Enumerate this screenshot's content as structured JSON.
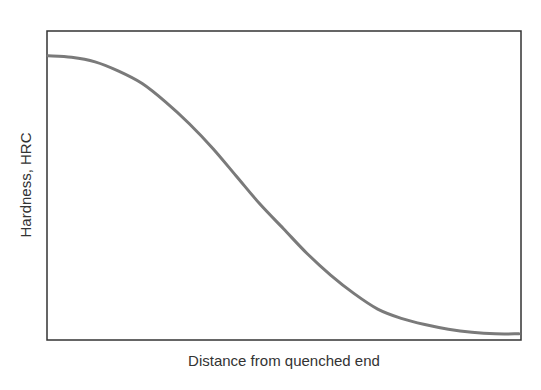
{
  "chart_data": {
    "type": "line",
    "title": "",
    "xlabel": "Distance from quenched end",
    "ylabel": "Hardness, HRC",
    "x_ticks": [],
    "y_ticks": [],
    "grid": false,
    "legend": null,
    "xlim": [
      0,
      1
    ],
    "ylim": [
      0,
      1
    ],
    "series": [
      {
        "name": "Jominy hardness profile",
        "color": "#7a7a7a",
        "x": [
          0.0,
          0.05,
          0.1,
          0.15,
          0.2,
          0.25,
          0.3,
          0.35,
          0.4,
          0.45,
          0.5,
          0.55,
          0.6,
          0.65,
          0.7,
          0.75,
          0.8,
          0.85,
          0.9,
          0.95,
          1.0
        ],
        "y": [
          0.92,
          0.915,
          0.9,
          0.87,
          0.83,
          0.77,
          0.7,
          0.62,
          0.53,
          0.44,
          0.36,
          0.28,
          0.21,
          0.15,
          0.1,
          0.07,
          0.05,
          0.035,
          0.025,
          0.02,
          0.02
        ]
      }
    ]
  },
  "colors": {
    "frame": "#333333",
    "curve": "#7a7a7a",
    "text": "#333333"
  }
}
